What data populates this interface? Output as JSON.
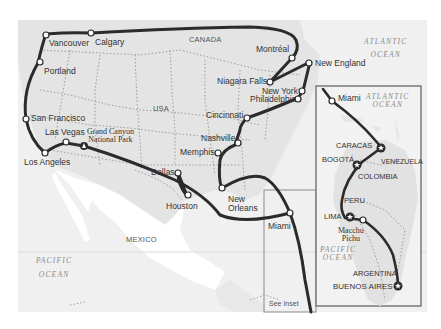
{
  "map": {
    "colors": {
      "background": "#ffffff",
      "land": "#e6e6e6",
      "water": "#f0f0f0",
      "mexico_land": "#ffffff",
      "route": "#2b2b2b",
      "border_dots": "#888888",
      "inset_frame": "#7a7a7a",
      "stop_fill": "#ffffff"
    },
    "regions": {
      "canada": "CANADA",
      "usa": "USA",
      "mexico": "MEXICO"
    },
    "oceans": {
      "atlantic_main": [
        "ATLANTIC",
        "OCEAN"
      ],
      "pacific_main": [
        "PACIFIC",
        "OCEAN"
      ],
      "atlantic_inset": [
        "ATLANTIC",
        "OCEAN"
      ],
      "pacific_inset": [
        "PACIFIC",
        "OCEAN"
      ]
    },
    "cities": {
      "vancouver": "Vancouver",
      "calgary": "Calgary",
      "portland": "Portland",
      "san_francisco": "San Francisco",
      "las_vegas": "Las Vegas",
      "grand_canyon": [
        "Grand Canyon",
        "National Park"
      ],
      "los_angeles": "Los Angeles",
      "montreal": "Montréal",
      "new_england": "New England",
      "niagara_falls": "Niagara Falls",
      "new_york": "New York",
      "philadelphia": "Philadelphia",
      "cincinnati": "Cincinnati",
      "nashville": "Nashville",
      "memphis": "Memphis",
      "dallas": "Dallas",
      "houston": "Houston",
      "new_orleans": [
        "New",
        "Orleans"
      ],
      "miami": "Miami"
    },
    "see_inset": "See Inset",
    "inset": {
      "miami": "Miami",
      "caracas": "CARACAS",
      "bogota": "BOGOTÁ",
      "venezuela": "VENEZUELA",
      "colombia": "COLOMBIA",
      "peru": "PERU",
      "lima": "LIMA",
      "machu_picchu": [
        "Macchu",
        "Pichu"
      ],
      "argentina": "ARGENTINA",
      "buenos_aires": "BUENOS AIRES"
    }
  }
}
